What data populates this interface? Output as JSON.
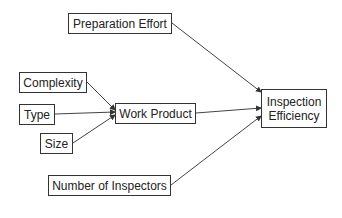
{
  "diagram": {
    "nodes": {
      "preparation_effort": {
        "label": "Preparation Effort"
      },
      "complexity": {
        "label": "Complexity"
      },
      "type": {
        "label": "Type"
      },
      "size": {
        "label": "Size"
      },
      "work_product": {
        "label": "Work Product"
      },
      "inspection_efficiency": {
        "line1": "Inspection",
        "line2": "Efficiency"
      },
      "number_of_inspectors": {
        "label": "Number of Inspectors"
      }
    },
    "edges": [
      {
        "from": "Complexity",
        "to": "Work Product"
      },
      {
        "from": "Type",
        "to": "Work Product"
      },
      {
        "from": "Size",
        "to": "Work Product"
      },
      {
        "from": "Preparation Effort",
        "to": "Inspection Efficiency"
      },
      {
        "from": "Work Product",
        "to": "Inspection Efficiency"
      },
      {
        "from": "Number of Inspectors",
        "to": "Inspection Efficiency"
      }
    ],
    "colors": {
      "line": "#444444",
      "border": "#333333",
      "text": "#222222"
    }
  }
}
